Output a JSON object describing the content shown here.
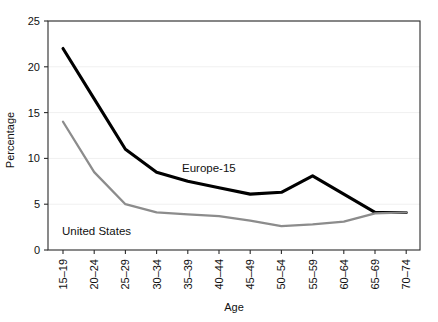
{
  "chart_data": {
    "type": "line",
    "title": "",
    "xlabel": "Age",
    "ylabel": "Percentage",
    "categories": [
      "15–19",
      "20–24",
      "25–29",
      "30–34",
      "35–39",
      "40–44",
      "45–49",
      "50–54",
      "55–59",
      "60–64",
      "65–69",
      "70–74"
    ],
    "ylim": [
      0,
      25
    ],
    "yticks": [
      "0",
      "5",
      "10",
      "15",
      "20",
      "25"
    ],
    "ytick_values": [
      0,
      5,
      10,
      15,
      20,
      25
    ],
    "grid": "horizontal-faint",
    "legend": "inline-annotations",
    "series": [
      {
        "name": "Europe-15",
        "color": "#000000",
        "width": 3.1,
        "values": [
          22.0,
          16.5,
          11.0,
          8.5,
          7.5,
          6.8,
          6.1,
          6.3,
          8.1,
          6.1,
          4.1,
          4.1
        ],
        "label_x": 182,
        "label_y": 172
      },
      {
        "name": "United States",
        "color": "#8c8c8c",
        "width": 2.3,
        "values": [
          14.0,
          8.5,
          5.0,
          4.1,
          3.9,
          3.7,
          3.2,
          2.6,
          2.8,
          3.1,
          4.0,
          4.1
        ],
        "label_x": 62,
        "label_y": 235
      }
    ]
  },
  "plot": {
    "left": 48,
    "right": 420,
    "top": 21,
    "bottom": 250,
    "first_tick_x": 63,
    "tick_step": 31.2,
    "frame_color": "#2b2b2b",
    "grid_color": "#f0f0f0"
  }
}
